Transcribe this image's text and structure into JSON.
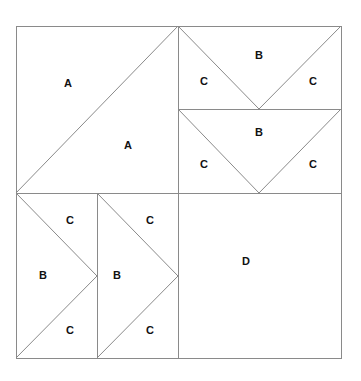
{
  "diagram": {
    "line_color": "#8a8a8a",
    "frame": {
      "x": 16,
      "y": 26,
      "w": 325,
      "h": 332
    },
    "pieces": [
      {
        "id": "A1",
        "label": "A",
        "x": 68,
        "y": 84
      },
      {
        "id": "A2",
        "label": "A",
        "x": 128,
        "y": 146
      },
      {
        "id": "B1",
        "label": "B",
        "x": 259,
        "y": 56
      },
      {
        "id": "C1",
        "label": "C",
        "x": 204,
        "y": 82
      },
      {
        "id": "C2",
        "label": "C",
        "x": 313,
        "y": 82
      },
      {
        "id": "B2",
        "label": "B",
        "x": 259,
        "y": 133
      },
      {
        "id": "C3",
        "label": "C",
        "x": 204,
        "y": 165
      },
      {
        "id": "C4",
        "label": "C",
        "x": 313,
        "y": 165
      },
      {
        "id": "C5",
        "label": "C",
        "x": 70,
        "y": 221
      },
      {
        "id": "B3",
        "label": "B",
        "x": 43,
        "y": 276
      },
      {
        "id": "C6",
        "label": "C",
        "x": 70,
        "y": 331
      },
      {
        "id": "C7",
        "label": "C",
        "x": 150,
        "y": 221
      },
      {
        "id": "B4",
        "label": "B",
        "x": 117,
        "y": 276
      },
      {
        "id": "C8",
        "label": "C",
        "x": 150,
        "y": 331
      },
      {
        "id": "D1",
        "label": "D",
        "x": 246,
        "y": 262
      }
    ]
  }
}
